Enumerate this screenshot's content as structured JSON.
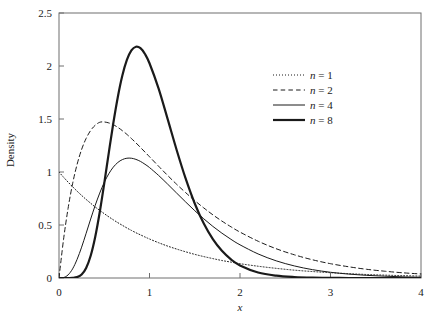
{
  "figure": {
    "background": "#ffffff",
    "frame_color": "#6e6e6e",
    "curve_color": "#1a1a1a"
  },
  "axes": {
    "x_title": "x",
    "y_title": "Density",
    "x_ticks": [
      "0",
      "1",
      "2",
      "3",
      "4"
    ],
    "y_ticks": [
      "0",
      "0.5",
      "1",
      "1.5",
      "2",
      "2.5"
    ]
  },
  "legend": {
    "entries": [
      {
        "label": "n = 1",
        "style": "dotted",
        "width": 1.0
      },
      {
        "label": "n = 2",
        "style": "dashed",
        "width": 1.0
      },
      {
        "label": "n = 4",
        "style": "solid",
        "width": 1.0
      },
      {
        "label": "n = 8",
        "style": "solid",
        "width": 2.2
      }
    ]
  },
  "chart_data": {
    "type": "line",
    "title": "",
    "subtitle": "",
    "xlabel": "x",
    "ylabel": "Density",
    "xlim": [
      0,
      4
    ],
    "ylim": [
      0,
      2.5
    ],
    "xticks": [
      0,
      1,
      2,
      3,
      4
    ],
    "yticks": [
      0,
      0.5,
      1,
      1.5,
      2,
      2.5
    ],
    "grid": false,
    "legend_position": "upper right",
    "x": [
      0,
      0.05,
      0.1,
      0.15,
      0.2,
      0.25,
      0.3,
      0.35,
      0.4,
      0.45,
      0.5,
      0.55,
      0.6,
      0.65,
      0.7,
      0.75,
      0.8,
      0.85,
      0.9,
      0.95,
      1,
      1.1,
      1.2,
      1.3,
      1.4,
      1.5,
      1.6,
      1.7,
      1.8,
      1.9,
      2,
      2.2,
      2.4,
      2.6,
      2.8,
      3,
      3.2,
      3.4,
      3.6,
      3.8,
      4
    ],
    "series": [
      {
        "name": "n = 1",
        "style": "dotted",
        "peak_x": 0,
        "peak_y": 1.0,
        "values": [
          1,
          0.951,
          0.905,
          0.861,
          0.819,
          0.779,
          0.741,
          0.705,
          0.67,
          0.638,
          0.607,
          0.577,
          0.549,
          0.522,
          0.497,
          0.472,
          0.449,
          0.427,
          0.407,
          0.387,
          0.368,
          0.333,
          0.301,
          0.273,
          0.247,
          0.223,
          0.202,
          0.183,
          0.165,
          0.15,
          0.135,
          0.111,
          0.091,
          0.074,
          0.061,
          0.05,
          0.041,
          0.033,
          0.027,
          0.022,
          0.018
        ]
      },
      {
        "name": "n = 2",
        "style": "dashed",
        "peak_x": 0.5,
        "peak_y": 0.736,
        "values": [
          0,
          0.362,
          0.655,
          0.889,
          1.072,
          1.213,
          1.317,
          1.392,
          1.441,
          1.469,
          1.472,
          1.463,
          1.446,
          1.421,
          1.39,
          1.355,
          1.316,
          1.275,
          1.232,
          1.188,
          1.144,
          1.055,
          0.968,
          0.884,
          0.805,
          0.73,
          0.661,
          0.596,
          0.537,
          0.483,
          0.433,
          0.347,
          0.276,
          0.219,
          0.172,
          0.135,
          0.106,
          0.082,
          0.064,
          0.049,
          0.038
        ]
      },
      {
        "name": "n = 4",
        "style": "solid",
        "peak_x": 0.75,
        "peak_y": 0.896,
        "values": [
          0,
          0.004,
          0.029,
          0.086,
          0.176,
          0.291,
          0.422,
          0.556,
          0.685,
          0.801,
          0.902,
          0.983,
          1.046,
          1.09,
          1.117,
          1.13,
          1.13,
          1.119,
          1.1,
          1.073,
          1.042,
          0.968,
          0.886,
          0.801,
          0.717,
          0.635,
          0.558,
          0.487,
          0.423,
          0.365,
          0.313,
          0.227,
          0.162,
          0.114,
          0.079,
          0.054,
          0.037,
          0.025,
          0.017,
          0.011,
          0.007
        ]
      },
      {
        "name": "n = 8",
        "style": "solid",
        "peak_x": 0.875,
        "peak_y": 2.01,
        "values": [
          0,
          0.0,
          0.0,
          0.001,
          0.008,
          0.033,
          0.095,
          0.21,
          0.387,
          0.62,
          0.893,
          1.181,
          1.46,
          1.708,
          1.91,
          2.057,
          2.147,
          2.182,
          2.168,
          2.113,
          2.026,
          1.789,
          1.501,
          1.208,
          0.937,
          0.703,
          0.513,
          0.366,
          0.256,
          0.176,
          0.119,
          0.052,
          0.022,
          0.009,
          0.003,
          0.001,
          0.0,
          0.0,
          0.0,
          0.0,
          0.0
        ]
      }
    ]
  }
}
